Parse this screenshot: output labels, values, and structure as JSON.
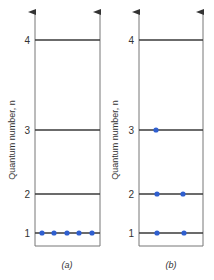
{
  "axis_label": "Quantum number, n",
  "colors": {
    "line": "#3a3a3a",
    "frame": "#777777",
    "electron": "#2f5fd0"
  },
  "panels": [
    {
      "id": "a",
      "caption": "(a)",
      "levels": [
        {
          "n": "4",
          "electrons": 0
        },
        {
          "n": "3",
          "electrons": 0
        },
        {
          "n": "2",
          "electrons": 0
        },
        {
          "n": "1",
          "electrons": 5
        }
      ]
    },
    {
      "id": "b",
      "caption": "(b)",
      "levels": [
        {
          "n": "4",
          "electrons": 0
        },
        {
          "n": "3",
          "electrons": 1
        },
        {
          "n": "2",
          "electrons": 2
        },
        {
          "n": "1",
          "electrons": 2
        }
      ]
    }
  ]
}
